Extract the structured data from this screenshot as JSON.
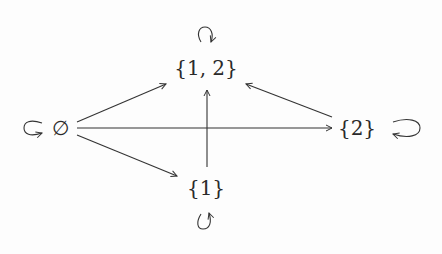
{
  "diagram": {
    "type": "directed-graph",
    "nodes": [
      {
        "id": "empty",
        "label": "∅",
        "x": 60,
        "y": 128,
        "self_loop": "left"
      },
      {
        "id": "n12",
        "label": "{1, 2}",
        "x": 206,
        "y": 68,
        "self_loop": "top"
      },
      {
        "id": "n2",
        "label": "{2}",
        "x": 357,
        "y": 128,
        "self_loop": "right"
      },
      {
        "id": "n1",
        "label": "{1}",
        "x": 206,
        "y": 188,
        "self_loop": "bottom"
      }
    ],
    "edges": [
      {
        "from": "empty",
        "to": "n12"
      },
      {
        "from": "empty",
        "to": "n2"
      },
      {
        "from": "empty",
        "to": "n1"
      },
      {
        "from": "n1",
        "to": "n12"
      },
      {
        "from": "n2",
        "to": "n12"
      }
    ],
    "colors": {
      "stroke": "#333333",
      "text": "#2a2a2a",
      "background": "#fdfdfd"
    }
  }
}
